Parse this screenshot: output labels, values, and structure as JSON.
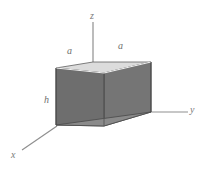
{
  "figure": {
    "type": "3d-triangular-prism-diagram",
    "background_color": "#ffffff",
    "axes": {
      "z": {
        "label": "z",
        "direction": "up"
      },
      "y": {
        "label": "y",
        "direction": "right"
      },
      "x": {
        "label": "x",
        "direction": "lower-left"
      },
      "origin_note": "axes meet at prism front-bottom corner",
      "axis_color": "#8a8a8a"
    },
    "dimensions": [
      {
        "name": "a-left",
        "label": "a",
        "edge": "top-left-slant"
      },
      {
        "name": "a-right",
        "label": "a",
        "edge": "top-right-ridge"
      },
      {
        "name": "h",
        "label": "h",
        "edge": "front-left-vertical"
      }
    ],
    "solid": {
      "name": "triangular prism",
      "face_colors": {
        "top": "#d7d7d7",
        "front_right": "#767676",
        "front_left": "#6f6f6f",
        "bottom": "#8c8c8c",
        "edge": "#4a4a4a"
      }
    }
  }
}
